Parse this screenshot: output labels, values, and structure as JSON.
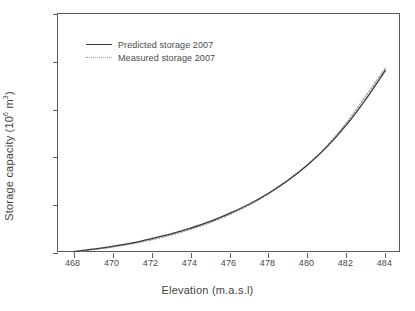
{
  "chart_data": {
    "type": "line",
    "title": "",
    "xlabel": "Elevation (m.a.s.l)",
    "ylabel_text": "Storage capacity (10",
    "ylabel_sup": "6",
    "ylabel_tail": " m",
    "ylabel_sup2": "3",
    "ylabel_close": ")",
    "ylabel": "Storage capacity (10^6 m^3)",
    "xlim": [
      467.2,
      484.8
    ],
    "ylim": [
      0,
      2500
    ],
    "grid": false,
    "legend_position": "upper-left-inside",
    "xticks": [
      468,
      470,
      472,
      474,
      476,
      478,
      480,
      482,
      484
    ],
    "yticks": [
      0,
      500,
      1000,
      1500,
      2000,
      2500
    ],
    "xtick_labels": [
      "468",
      "470",
      "472",
      "474",
      "476",
      "478",
      "480",
      "482",
      "484"
    ],
    "ytick_labels": [
      "0",
      "500",
      "1000",
      "1500",
      "2000",
      "2500"
    ],
    "x": [
      468,
      469,
      470,
      471,
      472,
      473,
      474,
      475,
      476,
      477,
      478,
      479,
      480,
      481,
      482,
      483,
      484
    ],
    "series": [
      {
        "name": "Predicted storage 2007",
        "style": "solid",
        "color": "#3a3a3a",
        "values": [
          15,
          40,
          70,
          105,
          150,
          200,
          260,
          330,
          415,
          510,
          625,
          760,
          920,
          1110,
          1340,
          1610,
          1910
        ]
      },
      {
        "name": "Measured storage 2007",
        "style": "dotted",
        "color": "#9a9a9a",
        "values": [
          12,
          34,
          62,
          96,
          138,
          188,
          248,
          318,
          402,
          500,
          618,
          756,
          922,
          1122,
          1362,
          1645,
          1935
        ]
      }
    ]
  },
  "legend": {
    "items": [
      {
        "label": "Predicted storage 2007",
        "style": "solid"
      },
      {
        "label": "Measured storage 2007",
        "style": "dotted"
      }
    ]
  }
}
